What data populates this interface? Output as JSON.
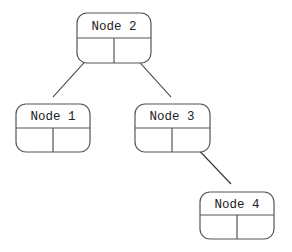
{
  "diagram": {
    "type": "binary-tree",
    "nodes": [
      {
        "id": "node-2",
        "label": "Node 2"
      },
      {
        "id": "node-1",
        "label": "Node 1"
      },
      {
        "id": "node-3",
        "label": "Node 3"
      },
      {
        "id": "node-4",
        "label": "Node 4"
      }
    ],
    "edges": [
      {
        "from": "node-2",
        "to": "node-1",
        "side": "left"
      },
      {
        "from": "node-2",
        "to": "node-3",
        "side": "right"
      },
      {
        "from": "node-3",
        "to": "node-4",
        "side": "right"
      }
    ],
    "colors": {
      "stroke": "#555555",
      "edge": "#333333",
      "text": "#222222",
      "background": "#ffffff"
    }
  }
}
